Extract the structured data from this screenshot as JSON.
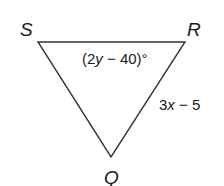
{
  "figure": {
    "type": "triangle",
    "vertices": [
      {
        "name": "S",
        "label": "S",
        "x": 38,
        "y": 42
      },
      {
        "name": "R",
        "label": "R",
        "x": 185,
        "y": 42
      },
      {
        "name": "Q",
        "label": "Q",
        "x": 111,
        "y": 157
      }
    ],
    "edges": [
      {
        "from": "S",
        "to": "R"
      },
      {
        "from": "R",
        "to": "Q",
        "label": {
          "coef": "3",
          "var": "x",
          "rest": " − 5"
        }
      },
      {
        "from": "Q",
        "to": "S"
      }
    ],
    "angles": [
      {
        "vertex": "R",
        "label": {
          "open": "(2",
          "var": "y",
          "rest": " − 40)°"
        }
      }
    ],
    "colors": {
      "stroke": "#333333",
      "text": "#1a1a1a",
      "background": "#ffffff"
    }
  }
}
